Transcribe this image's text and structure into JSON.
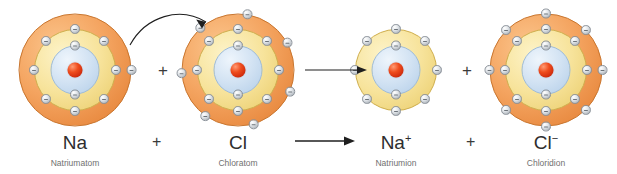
{
  "diagram": {
    "background_color": "#ffffff",
    "colors": {
      "outer_shell": "#f4a460",
      "middle_shell": "#f7e39b",
      "inner_shell": "#d3e3f3",
      "nucleus": "#ef4d1e",
      "electron": "#e2e6ea",
      "arrow": "#1f1f1f",
      "formula_text": "#2e2e2e",
      "caption_text": "#707070"
    }
  },
  "species": [
    {
      "id": "sodium-atom",
      "formula": "Na",
      "charge": "",
      "caption": "Natriumatom",
      "center_x": 75,
      "center_y": 70,
      "shells": [
        {
          "name": "outer-shell",
          "color": "#f4a460",
          "diameter": 113,
          "electrons": 1,
          "start_angle": 0
        },
        {
          "name": "middle-shell",
          "color": "#f7e39b",
          "diameter": 82,
          "electrons": 8,
          "start_angle": -90
        },
        {
          "name": "inner-shell",
          "color": "#d3e3f3",
          "diameter": 49,
          "electrons": 2,
          "start_angle": -90
        }
      ],
      "nucleus_diameter": 15
    },
    {
      "id": "chlorine-atom",
      "formula": "Cl",
      "charge": "",
      "caption": "Chloratom",
      "center_x": 238,
      "center_y": 70,
      "shells": [
        {
          "name": "outer-shell",
          "color": "#f4a460",
          "diameter": 113,
          "electrons": 7,
          "start_angle": 22.5
        },
        {
          "name": "middle-shell",
          "color": "#f7e39b",
          "diameter": 82,
          "electrons": 8,
          "start_angle": -90
        },
        {
          "name": "inner-shell",
          "color": "#d3e3f3",
          "diameter": 49,
          "electrons": 2,
          "start_angle": -90
        }
      ],
      "nucleus_diameter": 15
    },
    {
      "id": "sodium-ion",
      "formula": "Na",
      "charge": "+",
      "caption": "Natriumion",
      "center_x": 396,
      "center_y": 70,
      "shells": [
        {
          "name": "middle-shell",
          "color": "#f7e39b",
          "diameter": 82,
          "electrons": 8,
          "start_angle": -90
        },
        {
          "name": "inner-shell",
          "color": "#d3e3f3",
          "diameter": 49,
          "electrons": 2,
          "start_angle": -90
        }
      ],
      "nucleus_diameter": 15
    },
    {
      "id": "chloride-ion",
      "formula": "Cl",
      "charge": "−",
      "caption": "Chloridion",
      "center_x": 546,
      "center_y": 70,
      "shells": [
        {
          "name": "outer-shell",
          "color": "#f4a460",
          "diameter": 113,
          "electrons": 8,
          "start_angle": -90
        },
        {
          "name": "middle-shell",
          "color": "#f7e39b",
          "diameter": 82,
          "electrons": 8,
          "start_angle": -90
        },
        {
          "name": "inner-shell",
          "color": "#d3e3f3",
          "diameter": 49,
          "electrons": 2,
          "start_angle": -90
        }
      ],
      "nucleus_diameter": 15
    }
  ],
  "operators": {
    "plus_top_1": "+",
    "plus_top_2": "+",
    "plus_bottom_1": "+",
    "plus_bottom_2": "+"
  },
  "arrows": {
    "electron_transfer": {
      "name": "electron-transfer-arrow",
      "from": "sodium-atom outer shell",
      "to": "chlorine-atom outer shell"
    },
    "reaction_top": {
      "name": "reaction-arrow-top"
    },
    "reaction_bottom": {
      "name": "reaction-arrow-bottom"
    }
  },
  "equation": {
    "left": [
      "Na",
      "+",
      "Cl"
    ],
    "right": [
      "Na⁺",
      "+",
      "Cl⁻"
    ]
  }
}
